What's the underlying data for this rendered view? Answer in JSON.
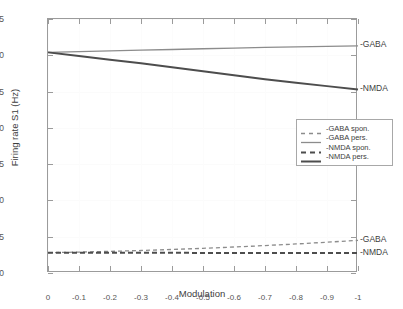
{
  "chart_data": {
    "type": "line",
    "title": "",
    "xlabel": "Modulation",
    "ylabel": "Firing rate S1 (Hz)",
    "xlim": [
      0,
      -1
    ],
    "ylim": [
      0,
      35
    ],
    "grid": true,
    "legend_position": "center-right-upper",
    "xticks": [
      "0",
      "-0.1",
      "-0.2",
      "-0.3",
      "-0.4",
      "-0.5",
      "-0.6",
      "-0.7",
      "-0.8",
      "-0.9",
      "-1"
    ],
    "xtick_values": [
      0,
      -0.1,
      -0.2,
      -0.3,
      -0.4,
      -0.5,
      -0.6,
      -0.7,
      -0.8,
      -0.9,
      -1
    ],
    "yticks": [
      "0",
      "5",
      "10",
      "15",
      "20",
      "25",
      "30",
      "35"
    ],
    "ytick_values": [
      0,
      5,
      10,
      15,
      20,
      25,
      30,
      35
    ],
    "x": [
      0,
      -0.1,
      -0.2,
      -0.3,
      -0.4,
      -0.5,
      -0.6,
      -0.7,
      -0.8,
      -0.9,
      -1
    ],
    "series": [
      {
        "name": "-GABA spon.",
        "style": "dashed",
        "color": "#8c8c8c",
        "width": 1.3,
        "values": [
          2.8,
          2.88,
          2.98,
          3.1,
          3.24,
          3.4,
          3.58,
          3.78,
          4.0,
          4.24,
          4.5
        ]
      },
      {
        "name": "-GABA pers.",
        "style": "solid",
        "color": "#8c8c8c",
        "width": 1.3,
        "values": [
          30.4,
          30.5,
          30.6,
          30.7,
          30.8,
          30.9,
          31.0,
          31.08,
          31.16,
          31.23,
          31.3
        ]
      },
      {
        "name": "-NMDA spon.",
        "style": "dashed",
        "color": "#4d4d4d",
        "width": 2.0,
        "values": [
          2.8,
          2.79,
          2.79,
          2.78,
          2.78,
          2.77,
          2.77,
          2.76,
          2.76,
          2.75,
          2.75
        ]
      },
      {
        "name": "-NMDA pers.",
        "style": "solid",
        "color": "#4d4d4d",
        "width": 2.0,
        "values": [
          30.4,
          29.9,
          29.4,
          28.9,
          28.35,
          27.8,
          27.25,
          26.7,
          26.2,
          25.75,
          25.3
        ]
      }
    ],
    "annotations": [
      {
        "text": "-GABA",
        "x": -1,
        "y": 31.3
      },
      {
        "text": "-NMDA",
        "x": -1,
        "y": 25.3
      },
      {
        "text": "-GABA",
        "x": -1,
        "y": 4.5
      },
      {
        "text": "-NMDA",
        "x": -1,
        "y": 2.75
      }
    ]
  },
  "legend": {
    "items": [
      {
        "label": "-GABA spon."
      },
      {
        "label": "-GABA pers."
      },
      {
        "label": "-NMDA spon."
      },
      {
        "label": "-NMDA pers."
      }
    ]
  },
  "colors": {
    "gaba": "#8c8c8c",
    "nmda": "#4d4d4d",
    "axis": "#9b9b9b",
    "text": "#3d3d3d",
    "grid": "#fbfbfb"
  }
}
